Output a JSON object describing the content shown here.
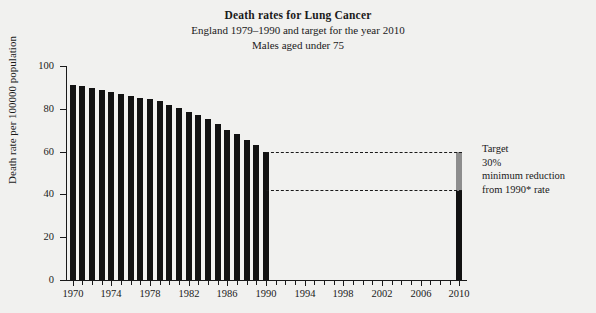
{
  "chart_data": {
    "type": "bar",
    "title": "Death rates for Lung Cancer",
    "subtitle": "England 1979–1990 and target for the year 2010",
    "subtitle2": "Males aged under 75",
    "xlabel": "",
    "ylabel": "Death rate per 100000 population",
    "ylim": [
      0,
      100
    ],
    "xlim": [
      1969.3,
      2010.7
    ],
    "ytick_values": [
      0,
      20,
      40,
      60,
      80,
      100
    ],
    "ytick_labels": [
      "0",
      "20",
      "40",
      "60",
      "80",
      "100"
    ],
    "xtick_labels": [
      "1970",
      "1974",
      "1978",
      "1982",
      "1986",
      "1990",
      "1994",
      "1998",
      "2002",
      "2006",
      "2010"
    ],
    "xtick_values": [
      1970,
      1974,
      1978,
      1982,
      1986,
      1990,
      1994,
      1998,
      2002,
      2006,
      2010
    ],
    "xtick_minor_values": [
      1971,
      1972,
      1973,
      1975,
      1976,
      1977,
      1979,
      1980,
      1981,
      1983,
      1984,
      1985,
      1987,
      1988,
      1989,
      1991,
      1992,
      1993,
      1995,
      1996,
      1997,
      1999,
      2000,
      2001,
      2003,
      2004,
      2005,
      2007,
      2008,
      2009
    ],
    "grid": false,
    "legend": false,
    "bar_color": "#121212",
    "target_color": "#8d8d8d",
    "categories": [
      1970,
      1971,
      1972,
      1973,
      1974,
      1975,
      1976,
      1977,
      1978,
      1979,
      1980,
      1981,
      1982,
      1983,
      1984,
      1985,
      1986,
      1987,
      1988,
      1989,
      1990
    ],
    "values": [
      91.0,
      90.5,
      89.5,
      89.0,
      88.0,
      87.0,
      86.0,
      85.0,
      84.5,
      83.5,
      82.0,
      80.5,
      78.5,
      77.0,
      75.0,
      73.0,
      70.0,
      68.0,
      65.5,
      63.0,
      60.0
    ],
    "target_bar": {
      "year": 2010,
      "total": 60.0,
      "achieved": 42.0,
      "reduction_segment": 18.0
    },
    "reference_lines": [
      {
        "value": 60.0,
        "from_year": 1990,
        "to_year": 2010,
        "style": "dashed"
      },
      {
        "value": 42.0,
        "from_year": 1990,
        "to_year": 2010,
        "style": "dashed"
      }
    ],
    "annotation": {
      "line1": "Target",
      "line2": "30%",
      "line3": "minimum reduction",
      "line4": "from 1990* rate"
    }
  }
}
